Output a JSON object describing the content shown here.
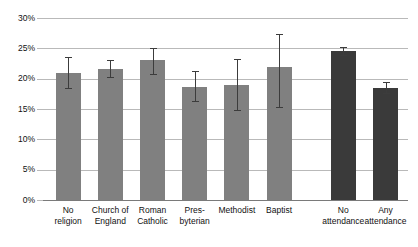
{
  "chart_data": {
    "type": "bar",
    "title": "",
    "subtitle": "",
    "xlabel": "",
    "ylabel": "",
    "ylim": [
      0,
      30
    ],
    "ytick_values": [
      0,
      5,
      10,
      15,
      20,
      25,
      30
    ],
    "ytick_labels": [
      "0%",
      "5%",
      "10%",
      "15%",
      "20%",
      "25%",
      "30%"
    ],
    "grid": true,
    "legend": "none",
    "value_suffix": "%",
    "categories": [
      "No religion",
      "Church of England",
      "Roman Catholic",
      "Presbyterian",
      "Methodist",
      "Baptist",
      "No attendance",
      "Any attendance"
    ],
    "category_lines": [
      [
        "No",
        "religion"
      ],
      [
        "Church of",
        "England"
      ],
      [
        "Roman",
        "Catholic"
      ],
      [
        "Pres-",
        "byterian"
      ],
      [
        "Methodist",
        ""
      ],
      [
        "Baptist",
        ""
      ],
      [
        "No",
        "attendance"
      ],
      [
        "Any",
        "attendance"
      ]
    ],
    "values": [
      21.0,
      21.6,
      23.0,
      18.6,
      18.9,
      22.0,
      24.6,
      18.5
    ],
    "error_low": [
      18.4,
      20.2,
      20.7,
      16.3,
      14.9,
      15.3,
      23.9,
      17.6
    ],
    "error_high": [
      23.5,
      23.0,
      25.1,
      21.2,
      23.2,
      27.3,
      25.3,
      19.4
    ],
    "groups": [
      {
        "name": "religion",
        "category_indices": [
          0,
          1,
          2,
          3,
          4,
          5
        ],
        "color": "#808080"
      },
      {
        "name": "attendance",
        "category_indices": [
          6,
          7
        ],
        "color": "#3a3a3a"
      }
    ],
    "colors": {
      "bar_light": "#808080",
      "bar_dark": "#3a3a3a",
      "gridline": "#b9b9b9",
      "axis": "#7a7a7a",
      "error_bar": "#3c3c3c",
      "text": "#111111",
      "background": "#ffffff"
    }
  }
}
